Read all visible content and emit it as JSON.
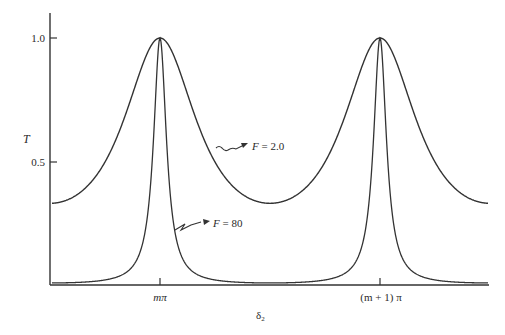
{
  "chart_data": {
    "type": "line",
    "title": "",
    "xlabel": "δ₂",
    "ylabel": "T",
    "x_ticks": [
      {
        "label": "mπ",
        "value": 0
      },
      {
        "label": "(m + 1) π",
        "value": 1
      }
    ],
    "y_ticks": [
      {
        "label": "1.0",
        "value": 1.0
      },
      {
        "label": "0.5",
        "value": 0.5
      }
    ],
    "xlim": [
      -0.5,
      1.5
    ],
    "ylim": [
      0,
      1.1
    ],
    "grid": false,
    "legend": "inline annotations with arrows",
    "x_unit": "π (δ₂ in units of π, offset by mπ)",
    "series": [
      {
        "name": "F = 2.0",
        "formula": "T = 1 / (1 + F sin²(δ₂))",
        "F": 2.0,
        "min": 0.33,
        "max": 1.0,
        "x": [
          -0.5,
          -0.25,
          -0.1,
          0,
          0.1,
          0.25,
          0.5,
          0.75,
          0.9,
          1.0,
          1.1,
          1.25,
          1.5
        ],
        "values": [
          0.33,
          0.5,
          0.84,
          1.0,
          0.84,
          0.5,
          0.33,
          0.5,
          0.84,
          1.0,
          0.84,
          0.5,
          0.33
        ]
      },
      {
        "name": "F = 80",
        "formula": "T = 1 / (1 + F sin²(δ₂))",
        "F": 80,
        "min": 0.012,
        "max": 1.0,
        "x": [
          -0.5,
          -0.25,
          -0.1,
          -0.03,
          0,
          0.03,
          0.1,
          0.25,
          0.5,
          0.75,
          0.9,
          0.97,
          1.0,
          1.03,
          1.1,
          1.25,
          1.5
        ],
        "values": [
          0.012,
          0.024,
          0.12,
          0.58,
          1.0,
          0.58,
          0.12,
          0.024,
          0.012,
          0.024,
          0.12,
          0.58,
          1.0,
          0.58,
          0.12,
          0.024,
          0.012
        ]
      }
    ],
    "annotations": [
      {
        "text": "F = 2.0",
        "points_to": "F = 2.0 curve"
      },
      {
        "text": "F = 80",
        "points_to": "F = 80 curve"
      }
    ]
  },
  "labels": {
    "y_axis": "T",
    "y_tick_1": "1.0",
    "y_tick_05": "0.5",
    "x_tick_m": "mπ",
    "x_tick_m1": "(m + 1) π",
    "x_axis_main": "δ",
    "x_axis_sub": "2",
    "ann_f2_F": "F",
    "ann_f2_val": " = 2.0",
    "ann_f80_F": "F",
    "ann_f80_val": " = 80"
  }
}
